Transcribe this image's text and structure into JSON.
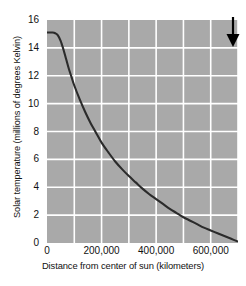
{
  "chart_data": {
    "type": "line",
    "title": "",
    "xlabel": "Distance from center of sun (kilometers)",
    "ylabel": "Solar temperature (millions of degrees Kelvin)",
    "xlim": [
      0,
      700000
    ],
    "ylim": [
      0,
      16
    ],
    "grid": true,
    "legend": "none",
    "background_color": "#a9a9a9",
    "gridline_color": "#ffffff",
    "line_color": "#2b2b2b",
    "x_ticks": [
      0,
      200000,
      400000,
      600000
    ],
    "x_tick_labels": [
      "0",
      "200,000",
      "400,000",
      "600,000"
    ],
    "x_gridlines": [
      100000,
      200000,
      300000,
      400000,
      500000,
      600000,
      700000
    ],
    "y_ticks": [
      0,
      2,
      4,
      6,
      8,
      10,
      12,
      14,
      16
    ],
    "y_tick_labels": [
      "0",
      "2",
      "4",
      "6",
      "8",
      "10",
      "12",
      "14",
      "16"
    ],
    "series": [
      {
        "name": "Solar temperature",
        "x": [
          0,
          10000,
          20000,
          30000,
          40000,
          50000,
          60000,
          70000,
          80000,
          90000,
          100000,
          120000,
          140000,
          160000,
          180000,
          200000,
          225000,
          250000,
          275000,
          300000,
          325000,
          350000,
          375000,
          400000,
          425000,
          450000,
          475000,
          500000,
          525000,
          550000,
          575000,
          600000,
          625000,
          650000,
          675000,
          700000
        ],
        "y": [
          15.1,
          15.1,
          15.1,
          15.05,
          14.9,
          14.5,
          13.9,
          13.2,
          12.5,
          11.9,
          11.3,
          10.3,
          9.4,
          8.6,
          7.9,
          7.2,
          6.5,
          5.85,
          5.3,
          4.8,
          4.35,
          3.9,
          3.5,
          3.15,
          2.8,
          2.45,
          2.15,
          1.85,
          1.6,
          1.35,
          1.1,
          0.9,
          0.7,
          0.5,
          0.3,
          0.1
        ]
      }
    ],
    "annotations": [
      {
        "name": "solar-surface-arrow",
        "type": "arrow",
        "direction": "down",
        "x": 700000,
        "y": 0,
        "label": ""
      }
    ]
  }
}
